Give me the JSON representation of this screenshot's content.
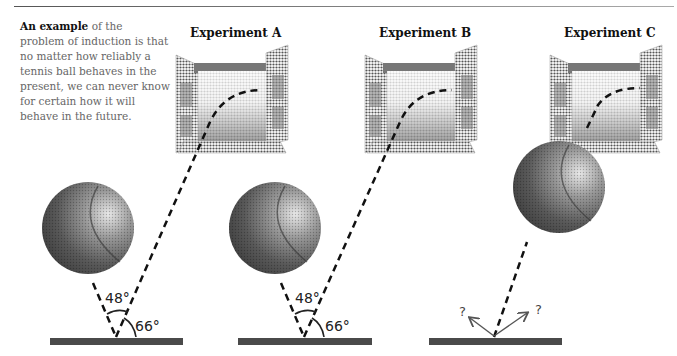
{
  "caption": {
    "bold": "An example",
    "rest": " of the problem of induction is that no matter how reliably a tennis ball behaves in the present, we can never know for certain how it will behave in the future."
  },
  "experiments": [
    {
      "title": "Experiment A",
      "angle_incidence": "48°",
      "angle_reflection": "66°"
    },
    {
      "title": "Experiment B",
      "angle_incidence": "48°",
      "angle_reflection": "66°"
    },
    {
      "title": "Experiment C",
      "unknown_left": "?",
      "unknown_right": "?"
    }
  ],
  "colors": {
    "ground": "#4a4a4a",
    "dash": "#111111",
    "arrow": "#555555"
  }
}
